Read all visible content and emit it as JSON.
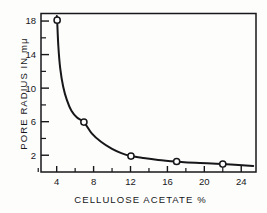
{
  "figure": {
    "background_color": "#fdfdfc",
    "ink_color": "#17171a"
  },
  "chart_data": {
    "type": "line",
    "title": "",
    "subtitle": "",
    "xlabel": "CELLULOSE ACETATE  %",
    "ylabel": "PORE RADIUS IN  mμ",
    "xlim": [
      2.3,
      25.6
    ],
    "ylim": [
      0.0,
      18.9
    ],
    "grid": false,
    "legend": false,
    "legend_position": "none",
    "marker": "open-circle",
    "line_style": "solid",
    "x_ticks_major": [
      4,
      8,
      12,
      16,
      20,
      24
    ],
    "x_tick_labels": [
      "4",
      "8",
      "12",
      "16",
      "20",
      "24"
    ],
    "x_ticks_minor": [
      2,
      6,
      10,
      14,
      18,
      22
    ],
    "y_ticks_major": [
      2,
      6,
      10,
      14,
      18
    ],
    "y_tick_labels": [
      "2",
      "6",
      "10",
      "14",
      "18"
    ],
    "y_ticks_minor": [
      4,
      8,
      12,
      16
    ],
    "x": [
      4.05,
      6.95,
      12.05,
      17.0,
      22.0
    ],
    "values": [
      18.1,
      5.95,
      1.9,
      1.25,
      0.95
    ],
    "points": [
      {
        "x": 4.05,
        "y": 18.1
      },
      {
        "x": 6.95,
        "y": 5.95
      },
      {
        "x": 12.05,
        "y": 1.9
      },
      {
        "x": 17.0,
        "y": 1.25
      },
      {
        "x": 22.0,
        "y": 0.95
      }
    ],
    "curve": [
      {
        "x": 4.02,
        "y": 18.6
      },
      {
        "x": 4.05,
        "y": 18.1
      },
      {
        "x": 4.18,
        "y": 15.0
      },
      {
        "x": 4.38,
        "y": 12.4
      },
      {
        "x": 4.7,
        "y": 10.2
      },
      {
        "x": 5.1,
        "y": 8.6
      },
      {
        "x": 5.6,
        "y": 7.3
      },
      {
        "x": 6.2,
        "y": 6.5
      },
      {
        "x": 6.95,
        "y": 5.95
      },
      {
        "x": 7.8,
        "y": 4.6
      },
      {
        "x": 8.8,
        "y": 3.6
      },
      {
        "x": 10.0,
        "y": 2.75
      },
      {
        "x": 11.0,
        "y": 2.25
      },
      {
        "x": 12.05,
        "y": 1.9
      },
      {
        "x": 13.4,
        "y": 1.66
      },
      {
        "x": 15.0,
        "y": 1.44
      },
      {
        "x": 17.0,
        "y": 1.25
      },
      {
        "x": 19.0,
        "y": 1.1
      },
      {
        "x": 22.0,
        "y": 0.95
      },
      {
        "x": 25.3,
        "y": 0.72
      }
    ]
  }
}
